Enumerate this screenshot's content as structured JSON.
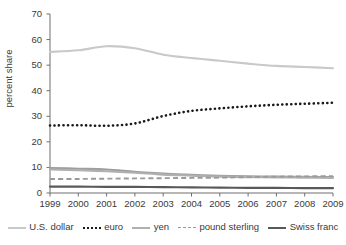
{
  "chart_data": {
    "type": "line",
    "title": "",
    "xlabel": "",
    "ylabel": "percent share",
    "x": [
      1999,
      2000,
      2001,
      2002,
      2003,
      2004,
      2005,
      2006,
      2007,
      2008,
      2009
    ],
    "xtick_labels": [
      "1999",
      "2000",
      "2001",
      "2002",
      "2003",
      "2004",
      "2005",
      "2006",
      "2007",
      "2008",
      "2009"
    ],
    "ytick_labels": [
      "0",
      "10",
      "20",
      "30",
      "40",
      "50",
      "60",
      "70"
    ],
    "yticks": [
      0,
      10,
      20,
      30,
      40,
      50,
      60,
      70
    ],
    "ylim": [
      0,
      70
    ],
    "xlim": [
      1999,
      2009
    ],
    "grid": false,
    "legend_position": "bottom",
    "series": [
      {
        "name": "U.S. dollar",
        "style": "solid",
        "color": "#c9c9c9",
        "values": [
          55.2,
          55.8,
          57.4,
          56.6,
          54.1,
          52.8,
          51.7,
          50.6,
          49.7,
          49.3,
          48.8
        ]
      },
      {
        "name": "euro",
        "style": "dotted",
        "color": "#1a1a1a",
        "values": [
          26.4,
          26.5,
          26.3,
          27.2,
          30.1,
          32.1,
          33.1,
          33.9,
          34.5,
          34.9,
          35.3
        ]
      },
      {
        "name": "yen",
        "style": "solid",
        "color": "#b0b0b0",
        "values": [
          9.2,
          8.9,
          8.5,
          7.9,
          7.2,
          6.8,
          6.4,
          6.2,
          6.1,
          6.0,
          5.9
        ]
      },
      {
        "name": "pound sterling",
        "style": "dashed",
        "color": "#9a9a9a",
        "values": [
          5.5,
          5.5,
          5.6,
          5.7,
          5.8,
          5.9,
          6.0,
          6.2,
          6.4,
          6.5,
          6.6
        ]
      },
      {
        "name": "Swiss franc",
        "style": "solid",
        "color": "#595959",
        "values": [
          2.5,
          2.5,
          2.4,
          2.4,
          2.3,
          2.2,
          2.1,
          2.0,
          2.0,
          1.9,
          1.9
        ]
      }
    ],
    "extra_lines": [
      {
        "name": "unlabeled-upper-gray",
        "style": "solid",
        "color": "#9e9e9e",
        "values": [
          9.8,
          9.5,
          9.2,
          8.3,
          7.6,
          7.1,
          6.7,
          6.5,
          6.4,
          6.3,
          6.2
        ]
      }
    ]
  },
  "legend": {
    "items": [
      {
        "label": "U.S. dollar",
        "key": "k-solid-light"
      },
      {
        "label": "euro",
        "key": "k-dotted"
      },
      {
        "label": "yen",
        "key": "k-solid-mid"
      },
      {
        "label": "pound sterling",
        "key": "k-dashed"
      },
      {
        "label": "Swiss franc",
        "key": "k-solid-dark"
      }
    ]
  }
}
